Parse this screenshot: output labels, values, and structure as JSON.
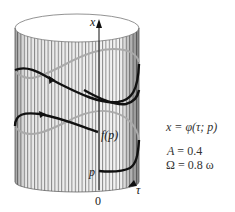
{
  "diagram": {
    "type": "cylinder-phase-portrait",
    "axes": {
      "vertical_label": "x",
      "horizontal_label": "τ",
      "origin_label": "0"
    },
    "points": {
      "start_label": "p",
      "map_label": "f(p)"
    },
    "equation": "x = φ(τ; p)",
    "parameters": [
      {
        "name": "A",
        "value": "0.4"
      },
      {
        "name": "Ω",
        "value": "0.8 ω"
      }
    ],
    "colors": {
      "curve_front": "#111111",
      "curve_back": "#aaaaaa",
      "stripes": "#888888",
      "background": "#ffffff"
    }
  }
}
